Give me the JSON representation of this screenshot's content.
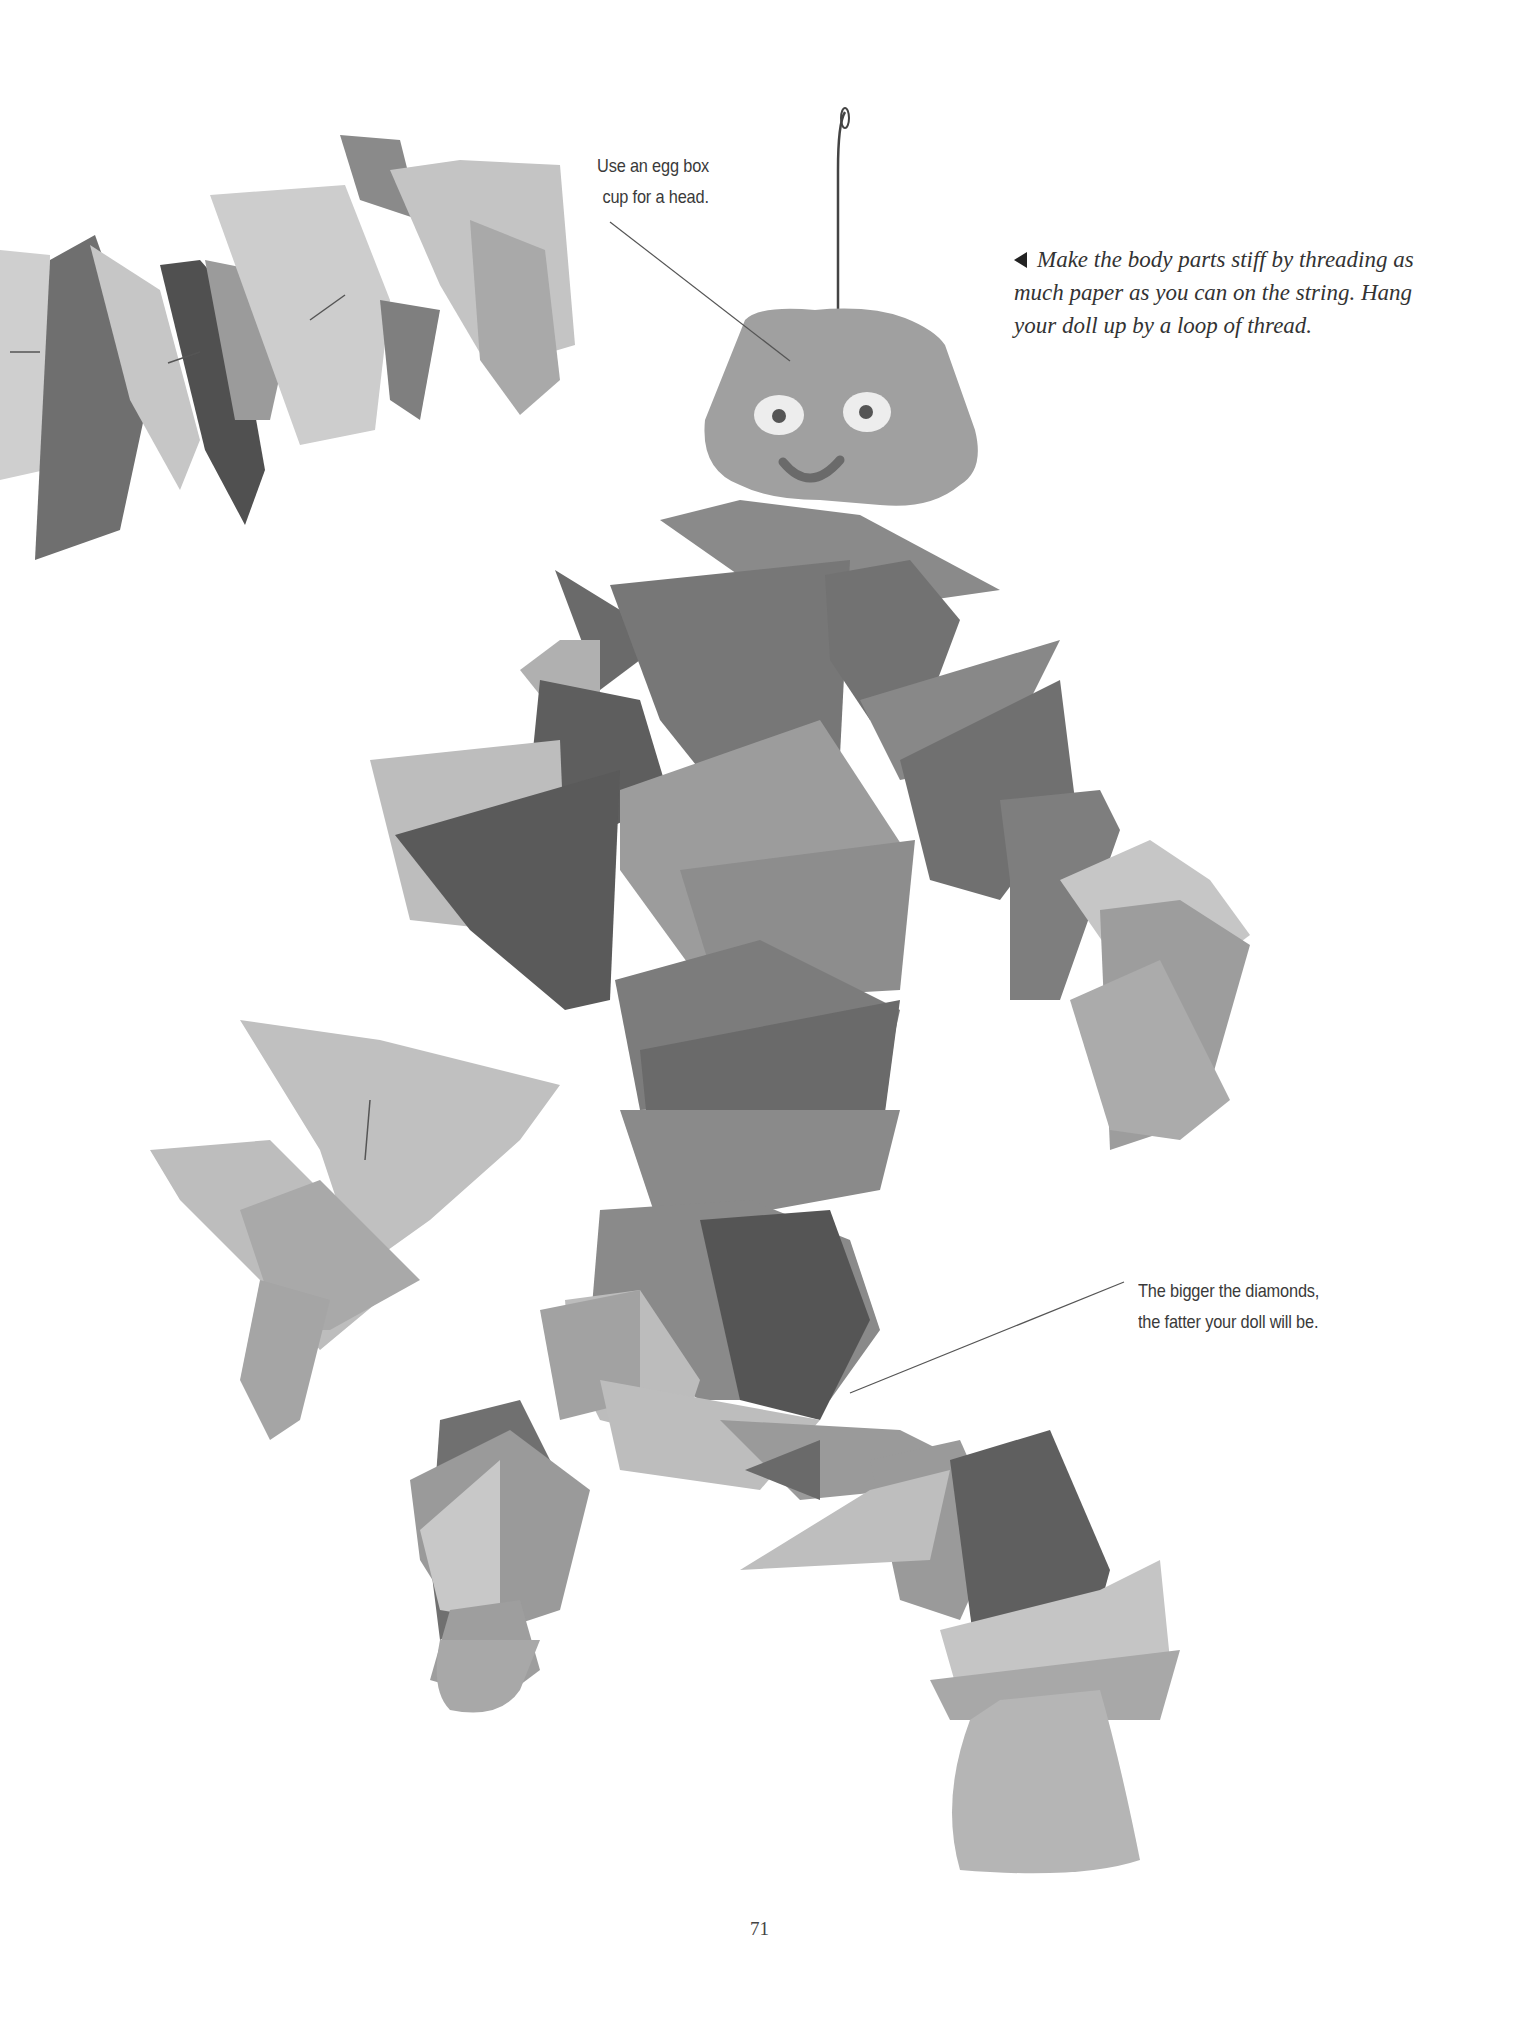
{
  "page": {
    "number": "71",
    "background": "#ffffff"
  },
  "captions": {
    "head": {
      "lines": [
        "Use an egg box",
        "cup for a head."
      ]
    },
    "instruction": {
      "icon": "arrow-left-icon",
      "lines": [
        "Make the body parts stiff by threading as",
        "much paper as you can on the string. Hang",
        "your doll up by a loop of thread."
      ]
    },
    "diamonds": {
      "lines": [
        "The bigger the diamonds,",
        "the fatter your doll will be."
      ]
    }
  },
  "photo": {
    "subject": "paper diamond doll with egg box cup head",
    "colors": {
      "light": "#c9c9c9",
      "mid": "#9a9a9a",
      "dark": "#6e6e6e",
      "darker": "#555555",
      "leader_line": "#555555"
    }
  }
}
